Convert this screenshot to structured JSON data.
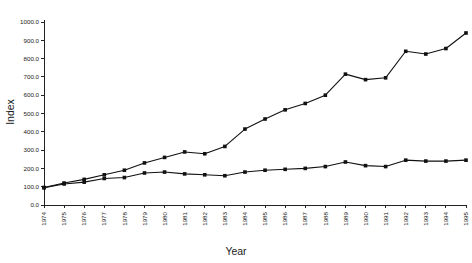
{
  "chart_data": {
    "type": "line",
    "title": "",
    "xlabel": "Year",
    "ylabel": "Index",
    "xlim": [
      1974,
      1995
    ],
    "ylim": [
      0,
      1000
    ],
    "grid": false,
    "legend": "none",
    "y_ticks": [
      "0.0",
      "100.0",
      "200.0",
      "300.0",
      "400.0",
      "500.0",
      "600.0",
      "700.0",
      "800.0",
      "900.0",
      "1000.0"
    ],
    "y_tick_values": [
      0,
      100,
      200,
      300,
      400,
      500,
      600,
      700,
      800,
      900,
      1000
    ],
    "categories": [
      "1974",
      "1975",
      "1976",
      "1977",
      "1978",
      "1979",
      "1980",
      "1981",
      "1982",
      "1983",
      "1984",
      "1985",
      "1986",
      "1987",
      "1988",
      "1989",
      "1990",
      "1991",
      "1992",
      "1993",
      "1994",
      "1995"
    ],
    "x": [
      1974,
      1975,
      1976,
      1977,
      1978,
      1979,
      1980,
      1981,
      1982,
      1983,
      1984,
      1985,
      1986,
      1987,
      1988,
      1989,
      1990,
      1991,
      1992,
      1993,
      1994,
      1995
    ],
    "series": [
      {
        "name": "upper-series",
        "marker": "square",
        "values": [
          95,
          120,
          140,
          165,
          190,
          230,
          260,
          290,
          280,
          320,
          415,
          470,
          520,
          555,
          600,
          715,
          685,
          695,
          840,
          825,
          855,
          940
        ]
      },
      {
        "name": "lower-series",
        "marker": "square",
        "values": [
          95,
          115,
          125,
          145,
          150,
          175,
          180,
          170,
          165,
          160,
          180,
          190,
          195,
          200,
          210,
          235,
          215,
          210,
          245,
          240,
          240,
          245
        ]
      }
    ]
  }
}
